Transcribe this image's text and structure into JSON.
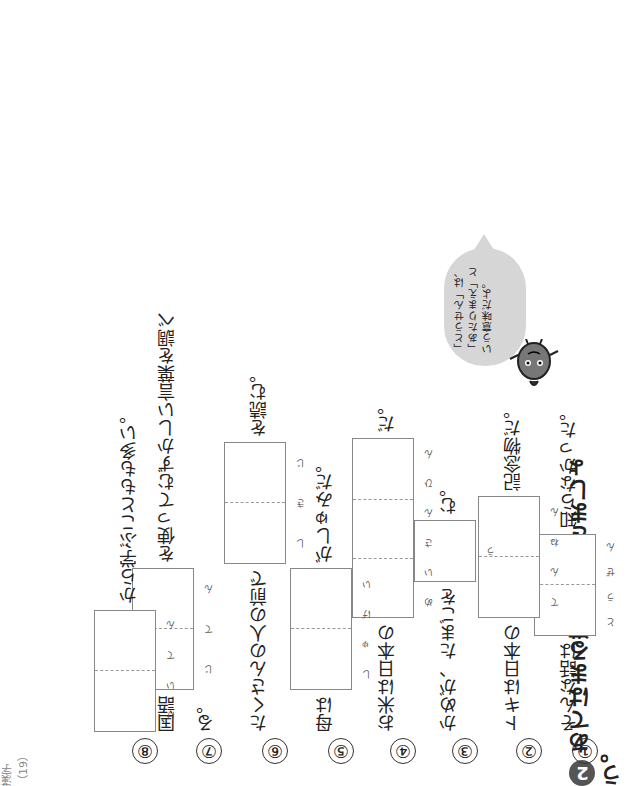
{
  "section": {
    "number": "2",
    "title": "あてはまる漢字を書きましょう。"
  },
  "page_number": "漢字（19）",
  "speech_bubble": "「とうせん」は、「あたりまえ」という意味だよ。",
  "mascot_icon": "acorn-character-icon",
  "items": [
    {
      "number": "①",
      "before": "そんな話は",
      "after": "知らなかった。",
      "furigana": [
        "と",
        "う",
        "ぜ",
        "ん"
      ],
      "boxes": 2
    },
    {
      "number": "②",
      "before": "トキは日本の",
      "after": "記念物だ。",
      "furigana": [
        "て",
        "ん",
        "ね",
        "ん"
      ],
      "boxes": 2
    },
    {
      "number": "③",
      "before": "かめが、たまごを",
      "after": "む。",
      "furigana": [
        "う"
      ],
      "boxes": 1
    },
    {
      "number": "④",
      "before": "お米は日本の",
      "after": "だ。",
      "furigana": [
        "め",
        "い",
        "さ",
        "ん",
        "ひ",
        "ん"
      ],
      "boxes": 3
    },
    {
      "number": "⑤",
      "before": "母は",
      "after": "がしゅみだ。",
      "furigana": [
        "し",
        "ゅ",
        "げ",
        "い"
      ],
      "boxes": 2
    },
    {
      "number": "⑥",
      "before": "たくさんの人の前で",
      "after": "を読む。",
      "furigana": [
        "し",
        "き",
        "じ"
      ],
      "boxes": 2
    },
    {
      "number": "⑦",
      "before": "国語",
      "after": "を使ってむずかしい言葉を調べる。",
      "furigana": [
        "じ",
        "て",
        "ん"
      ],
      "boxes": 2
    },
    {
      "number": "⑧",
      "before": "",
      "after": "から学ぶこともも多い。",
      "furigana": [
        "け",
        "い",
        "て",
        "ん"
      ],
      "boxes": 2
    }
  ]
}
